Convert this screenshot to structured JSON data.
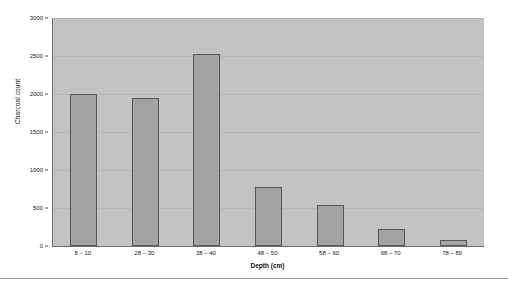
{
  "chart_data": {
    "type": "bar",
    "title": "",
    "xlabel": "Depth (cm)",
    "ylabel": "Charcoal count",
    "categories": [
      "8 – 10",
      "28 – 30",
      "38 – 40",
      "48 – 50",
      "58 – 60",
      "68 – 70",
      "78 – 80"
    ],
    "values": [
      2000,
      1950,
      2520,
      775,
      540,
      220,
      80
    ],
    "ylim": [
      0,
      3000
    ],
    "yticks": [
      0,
      500,
      1000,
      1500,
      2000,
      2500,
      3000
    ],
    "ytick_labels": [
      "0",
      "500",
      "1000",
      "1500",
      "2000",
      "2500",
      "3000"
    ],
    "grid": true,
    "legend": false,
    "bar_color": "#a3a3a3",
    "bar_edge_color": "#585858",
    "plot_background": "#c3c3c3",
    "page_background": "#ffffff"
  }
}
